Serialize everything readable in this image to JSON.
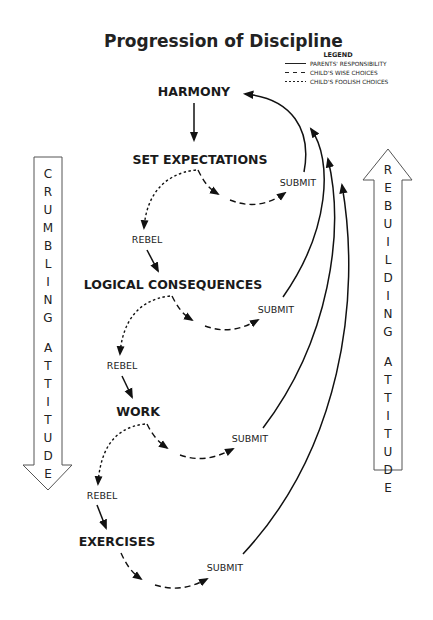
{
  "title": "Progression of Discipline",
  "legend": {
    "heading": "LEGEND",
    "items": [
      {
        "style": "solid",
        "label": "PARENTS' RESPONSIBILITY"
      },
      {
        "style": "long-dash",
        "label": "CHILD'S WISE CHOICES"
      },
      {
        "style": "short-dash",
        "label": "CHILD'S FOOLISH CHOICES"
      }
    ]
  },
  "nodes": {
    "harmony": "HARMONY",
    "set_expectations": "SET EXPECTATIONS",
    "logical_consequences": "LOGICAL CONSEQUENCES",
    "work": "WORK",
    "exercises": "EXERCISES"
  },
  "labels": {
    "submit": "SUBMIT",
    "rebel": "REBEL"
  },
  "left_arrow": {
    "direction": "down",
    "letters": [
      "C",
      "R",
      "U",
      "M",
      "B",
      "L",
      "I",
      "N",
      "G",
      "",
      "A",
      "T",
      "T",
      "I",
      "T",
      "U",
      "D",
      "E"
    ],
    "text": "CRUMBLING ATTITUDE"
  },
  "right_arrow": {
    "direction": "up",
    "letters": [
      "R",
      "E",
      "B",
      "U",
      "I",
      "L",
      "D",
      "I",
      "N",
      "G",
      "",
      "A",
      "T",
      "T",
      "I",
      "T",
      "U",
      "D",
      "E"
    ],
    "text": "REBUILDING ATTITUDE"
  }
}
